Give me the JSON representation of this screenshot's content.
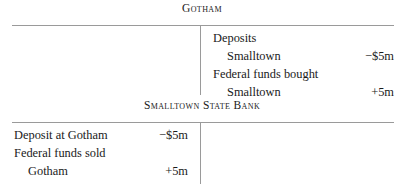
{
  "accounts": [
    {
      "title": "Gotham",
      "left_entries": [],
      "right_entries": [
        {
          "label": "Deposits",
          "amount": "",
          "indented": false
        },
        {
          "label": "Smalltown",
          "amount": "−$5m",
          "indented": true
        },
        {
          "label": "Federal funds bought",
          "amount": "",
          "indented": false
        },
        {
          "label": "Smalltown",
          "amount": "+5m",
          "indented": true
        }
      ]
    },
    {
      "title": "Smalltown State Bank",
      "left_entries": [
        {
          "label": "Deposit at Gotham",
          "amount": "−$5m",
          "indented": false
        },
        {
          "label": "Federal funds sold",
          "amount": "",
          "indented": false
        },
        {
          "label": "Gotham",
          "amount": "+5m",
          "indented": true
        }
      ],
      "right_entries": []
    }
  ],
  "style": {
    "rule_color": "#9a9a9a",
    "text_color": "#1a1a1a",
    "background": "#ffffff"
  }
}
